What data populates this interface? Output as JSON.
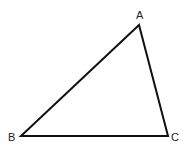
{
  "diagram": {
    "type": "triangle",
    "stroke_color": "#111111",
    "vertices": [
      {
        "label": "A",
        "x": 139,
        "y": 25
      },
      {
        "label": "B",
        "x": 21,
        "y": 136
      },
      {
        "label": "C",
        "x": 168,
        "y": 136
      }
    ],
    "labels": {
      "A": "A",
      "B": "B",
      "C": "C"
    }
  }
}
